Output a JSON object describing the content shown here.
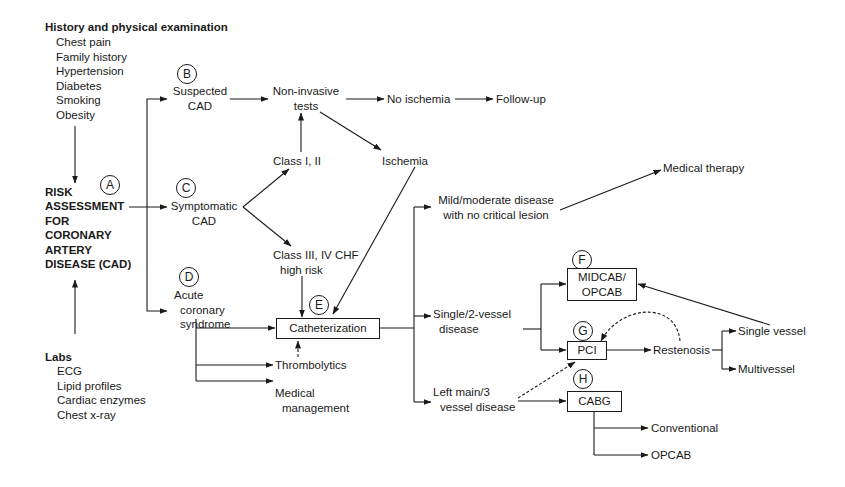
{
  "history": {
    "heading": "History and physical examination",
    "items": [
      "Chest pain",
      "Family history",
      "Hypertension",
      "Diabetes",
      "Smoking",
      "Obesity"
    ]
  },
  "labs": {
    "heading": "Labs",
    "items": [
      "ECG",
      "Lipid profiles",
      "Cardiac enzymes",
      "Chest x-ray"
    ]
  },
  "risk": {
    "lines": [
      "RISK",
      "ASSESSMENT",
      "FOR",
      "CORONARY",
      "ARTERY",
      "DISEASE (CAD)"
    ]
  },
  "markers": {
    "A": "A",
    "B": "B",
    "C": "C",
    "D": "D",
    "E": "E",
    "F": "F",
    "G": "G",
    "H": "H"
  },
  "nodes": {
    "suspected": [
      "Suspected",
      "CAD"
    ],
    "symptomatic": [
      "Symptomatic",
      "CAD"
    ],
    "acute": [
      "Acute",
      "coronary",
      "syndrome"
    ],
    "noninvasive": [
      "Non-invasive",
      "tests"
    ],
    "no_ischemia": "No ischemia",
    "follow_up": "Follow-up",
    "class12": "Class I, II",
    "ischemia": "Ischemia",
    "class34": [
      "Class III, IV CHF",
      "high risk"
    ],
    "catheterization": "Catheterization",
    "thrombolytics": "Thrombolytics",
    "medical_management": [
      "Medical",
      "management"
    ],
    "mild": [
      "Mild/moderate disease",
      "with no critical lesion"
    ],
    "medical_therapy": "Medical therapy",
    "single2": [
      "Single/2-vessel",
      "disease"
    ],
    "leftmain": [
      "Left main/3",
      "vessel disease"
    ],
    "midcab": [
      "MIDCAB/",
      "OPCAB"
    ],
    "pci": "PCI",
    "cabg": "CABG",
    "restenosis": "Restenosis",
    "single_vessel": "Single vessel",
    "multivessel": "Multivessel",
    "conventional": "Conventional",
    "opcab": "OPCAB"
  },
  "colors": {
    "ink": "#1a1a1a",
    "background": "#ffffff"
  }
}
